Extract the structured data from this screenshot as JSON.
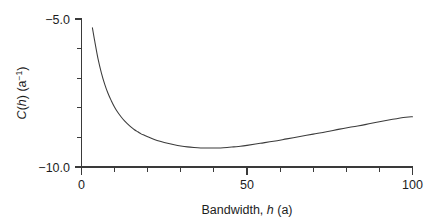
{
  "chart_data": {
    "type": "line",
    "title": "",
    "subtitle": "",
    "xlabel": "Bandwidth, h (a)",
    "xlabel_parts": {
      "prefix": "Bandwidth, ",
      "italic": "h",
      "suffix": " (a)"
    },
    "ylabel": "C(h) (a−1)",
    "ylabel_parts": {
      "c": "C",
      "open": "(",
      "italic": "h",
      "close": ") (a",
      "superscript": "−1",
      "tail": ")"
    },
    "xlim": [
      0,
      100
    ],
    "ylim": [
      -10.0,
      -5.0
    ],
    "grid": false,
    "legend": null,
    "x_major_ticks": [
      0,
      50,
      100
    ],
    "x_major_tick_labels": [
      "0",
      "50",
      "100"
    ],
    "x_minor_tick_interval": 10,
    "x_minor_ticks": [
      10,
      20,
      30,
      40,
      60,
      70,
      80,
      90
    ],
    "y_major_ticks": [
      -5.0,
      -10.0
    ],
    "y_major_tick_labels": [
      "−5.0",
      "−10.0"
    ],
    "y_minor_tick_interval": 1.0,
    "y_minor_ticks": [
      -6.0,
      -7.0,
      -8.0,
      -9.0
    ],
    "series": [
      {
        "name": "C(h)",
        "color": "#3b3b3b",
        "x": [
          3.3,
          4,
          5,
          6,
          7,
          8,
          9,
          10,
          11,
          12,
          13,
          14,
          15,
          16,
          17,
          18,
          19,
          20,
          22,
          24,
          26,
          28,
          30,
          32,
          34,
          36,
          38,
          40,
          42,
          44,
          46,
          48,
          50,
          54,
          58,
          62,
          66,
          70,
          74,
          78,
          82,
          86,
          90,
          94,
          98,
          100
        ],
        "y": [
          -5.3,
          -5.75,
          -6.35,
          -6.82,
          -7.2,
          -7.51,
          -7.76,
          -7.98,
          -8.16,
          -8.31,
          -8.44,
          -8.55,
          -8.65,
          -8.74,
          -8.81,
          -8.88,
          -8.93,
          -8.98,
          -9.07,
          -9.14,
          -9.2,
          -9.25,
          -9.29,
          -9.32,
          -9.34,
          -9.355,
          -9.36,
          -9.36,
          -9.355,
          -9.34,
          -9.32,
          -9.3,
          -9.27,
          -9.2,
          -9.13,
          -9.05,
          -8.97,
          -8.89,
          -8.81,
          -8.72,
          -8.64,
          -8.56,
          -8.47,
          -8.39,
          -8.32,
          -8.3
        ]
      }
    ],
    "annotations": []
  },
  "figure": {
    "background_color": "#ffffff",
    "axis_color": "#3a3a3a",
    "text_color": "#1d1d1d"
  }
}
